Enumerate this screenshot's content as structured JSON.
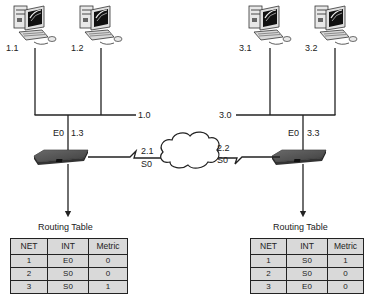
{
  "networks": {
    "left_lan": {
      "label": "1.0"
    },
    "right_lan": {
      "label": "3.0"
    }
  },
  "hosts": [
    {
      "id": "host-1-1",
      "label": "1.1"
    },
    {
      "id": "host-1-2",
      "label": "1.2"
    },
    {
      "id": "host-3-1",
      "label": "3.1"
    },
    {
      "id": "host-3-2",
      "label": "3.2"
    }
  ],
  "routers": {
    "left": {
      "eth_interface": "E0",
      "eth_address": "1.3",
      "serial_interface": "S0",
      "serial_address": "2.1"
    },
    "right": {
      "eth_interface": "E0",
      "eth_address": "3.3",
      "serial_interface": "S0",
      "serial_address": "2.2"
    }
  },
  "routing_tables": {
    "left": {
      "title": "Routing Table",
      "headers": [
        "NET",
        "INT",
        "Metric"
      ],
      "rows": [
        [
          "1",
          "E0",
          "0"
        ],
        [
          "2",
          "S0",
          "0"
        ],
        [
          "3",
          "S0",
          "1"
        ]
      ]
    },
    "right": {
      "title": "Routing Table",
      "headers": [
        "NET",
        "INT",
        "Metric"
      ],
      "rows": [
        [
          "1",
          "S0",
          "1"
        ],
        [
          "2",
          "S0",
          "0"
        ],
        [
          "3",
          "E0",
          "0"
        ]
      ]
    }
  },
  "colors": {
    "line": "#222222",
    "router_body": "#3a3a3a",
    "table_fill": "#d9d9d9"
  }
}
